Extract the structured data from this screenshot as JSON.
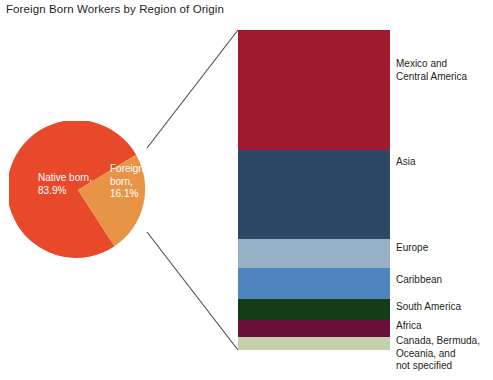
{
  "title": "Foreign Born Workers by Region of Origin",
  "chart_data": {
    "type": "pie",
    "title": "Foreign Born Workers by Region of Origin",
    "xlabel": "",
    "ylabel": "",
    "categories": [
      "Native born",
      "Foreign born"
    ],
    "values": [
      83.9,
      16.1
    ],
    "value_unit": "%",
    "labels": [
      "Native born,\n83.9%",
      "Foreign born,\n16.1%"
    ],
    "colors": [
      "#E8492B",
      "#E79447"
    ],
    "legend": "none",
    "grid": false,
    "breakout": {
      "type": "bar",
      "orientation": "vertical-stacked",
      "note": "Breakout of the 16.1% foreign born slice by region of origin",
      "categories": [
        "Mexico and\nCentral America",
        "Asia",
        "Europe",
        "Caribbean",
        "South America",
        "Africa",
        "Canada, Bermuda,\nOceania, and\nnot specified"
      ],
      "values": [
        37.5,
        27.8,
        9.1,
        9.7,
        6.6,
        5.3,
        4.0
      ],
      "value_unit": "% of foreign born",
      "colors": [
        "#9E1B2F",
        "#2C4866",
        "#97B2C6",
        "#4E85BE",
        "#133D17",
        "#6A1038",
        "#C5D1AE"
      ]
    }
  },
  "pie": {
    "native_label": "Native born,\n83.9%",
    "foreign_label": "Foreign born,\n16.1%",
    "native_color": "#E8492B",
    "foreign_color": "#E79447"
  },
  "bar": {
    "segments": [
      {
        "label": "Mexico and\nCentral America",
        "color": "#9E1B2F",
        "height": 120
      },
      {
        "label": "Asia",
        "color": "#2C4866",
        "height": 89
      },
      {
        "label": "Europe",
        "color": "#97B2C6",
        "height": 29
      },
      {
        "label": "Caribbean",
        "color": "#4E85BE",
        "height": 31
      },
      {
        "label": "South America",
        "color": "#133D17",
        "height": 21
      },
      {
        "label": "Africa",
        "color": "#6A1038",
        "height": 17
      },
      {
        "label": "Canada, Bermuda,\nOceania, and\nnot specified",
        "color": "#C5D1AE",
        "height": 13
      }
    ],
    "label_tops": [
      58,
      156,
      242,
      274,
      301,
      320,
      335
    ]
  }
}
